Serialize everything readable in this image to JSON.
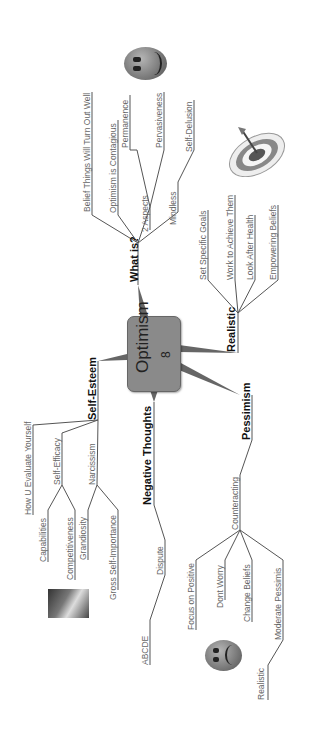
{
  "central": {
    "title": "Optimism",
    "count": "8",
    "fill": "#8a8a8a"
  },
  "branches": {
    "what_is": {
      "label": "What is?",
      "children": [
        "Belief Things Will Turn Out Well",
        "Optimism is Contagious",
        "2 Aspects",
        "Permanence",
        "Pervasiveness",
        "Mindless",
        "Self-Delusion"
      ]
    },
    "realistic": {
      "label": "Realistic",
      "children": [
        "Set Specific Goals",
        "Work to Achieve Them",
        "Look After Health",
        "Empowering Beliefs"
      ]
    },
    "self_esteem": {
      "label": "Self-Esteem",
      "children": [
        "How U Evaluate Yourself",
        "Self-Efficacy",
        "Capabilities",
        "Competitiveness",
        "Narcissism",
        "Grandiosity",
        "Gross Self-Importance"
      ]
    },
    "negative_thoughts": {
      "label": "Negative Thoughts",
      "children": [
        "Dispute",
        "ABCDE"
      ]
    },
    "pessimism": {
      "label": "Pessimism",
      "children": [
        "Counteracting",
        "Focus on Positive",
        "Dont Worry",
        "Change Beliefs",
        "Moderate Pessimis",
        "Realistic"
      ]
    }
  },
  "images": [
    "smiley-face-icon",
    "target-dart-icon",
    "photo-thumbnail",
    "sad-face-icon"
  ]
}
